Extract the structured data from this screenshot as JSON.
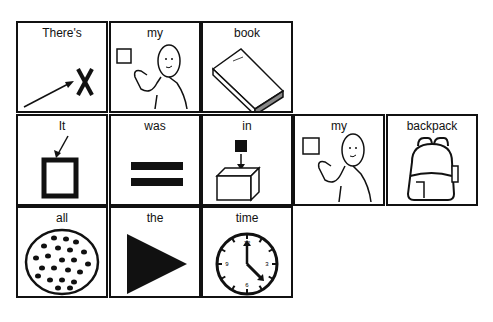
{
  "board": {
    "rows": [
      [
        {
          "word": "There's",
          "icon": "pointing-arrow-x-icon"
        },
        {
          "word": "my",
          "icon": "person-self-icon"
        },
        {
          "word": "book",
          "icon": "book-icon"
        }
      ],
      [
        {
          "word": "It",
          "icon": "arrow-to-square-icon"
        },
        {
          "word": "was",
          "icon": "equals-icon"
        },
        {
          "word": "in",
          "icon": "into-box-icon"
        },
        {
          "word": "my",
          "icon": "person-self-icon"
        },
        {
          "word": "backpack",
          "icon": "backpack-icon"
        }
      ],
      [
        {
          "word": "all",
          "icon": "dotted-circle-icon"
        },
        {
          "word": "the",
          "icon": "triangle-icon"
        },
        {
          "word": "time",
          "icon": "clock-icon"
        }
      ]
    ],
    "clock_numbers": [
      "12",
      "3",
      "6",
      "9"
    ]
  }
}
